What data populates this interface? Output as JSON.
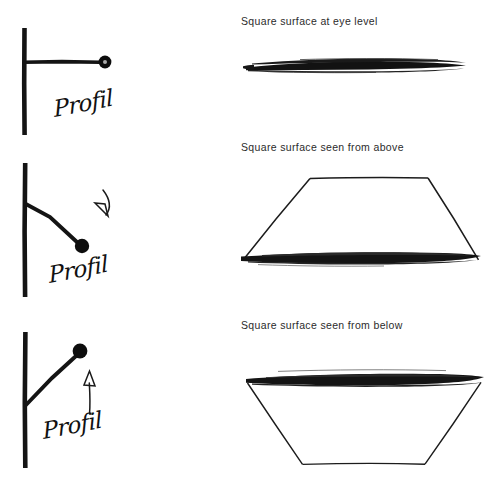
{
  "figure": {
    "background_color": "#ffffff",
    "ink_color": "#111111",
    "caption_color": "#2b2b2b",
    "width": 496,
    "height": 487
  },
  "captions": {
    "eye_level": "Square surface at eye level",
    "from_above": "Square surface seen from above",
    "from_below": "Square surface seen from below"
  },
  "profil_labels": {
    "row1": "Profil",
    "row2": "Profil",
    "row3": "Profil"
  },
  "rows": [
    {
      "id": "row-eye-level",
      "caption": "Square surface at eye level",
      "profil_label": "Profil",
      "sightline_direction": "horizontal",
      "arrow": "none",
      "shape": "edge-on line",
      "shape_description": "Thick horizontal brush stroke; square seen exactly edge-on"
    },
    {
      "id": "row-from-above",
      "caption": "Square surface seen from above",
      "profil_label": "Profil",
      "sightline_direction": "downward",
      "arrow": "curved arrow pointing down",
      "shape": "trapezoid narrow top wide bottom",
      "shape_description": "Trapezoid with short top edge and thick black wide bottom edge"
    },
    {
      "id": "row-from-below",
      "caption": "Square surface seen from below",
      "profil_label": "Profil",
      "sightline_direction": "upward",
      "arrow": "straight arrow pointing up",
      "shape": "trapezoid wide top narrow bottom",
      "shape_description": "Inverted trapezoid with thick black wide top edge and short bottom edge"
    }
  ],
  "icons": {
    "eye_dot": "eye-position-dot",
    "profile_axis": "vertical-profile-line",
    "sight_ray": "sight-ray-line",
    "arrow_down": "curved-down-arrow",
    "arrow_up": "straight-up-arrow"
  }
}
